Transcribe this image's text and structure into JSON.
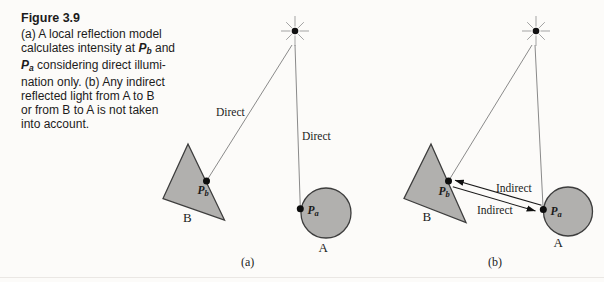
{
  "caption": {
    "title": "Figure 3.9",
    "l1": "(a) A local reflection model",
    "l2_pre": "calculates intensity at ",
    "l2_p": "P",
    "l2_sub": "b",
    "l2_post": " and",
    "l3_p": "P",
    "l3_sub": "a",
    "l3_post": " considering direct illumi-",
    "l4": "nation only. (b) Any indirect",
    "l5": "reflected light from A to B",
    "l6": "or from B to A is not taken",
    "l7": "into account."
  },
  "diagram_a": {
    "label_direct_upper": "Direct",
    "label_direct_lower": "Direct",
    "point_b": {
      "p": "P",
      "sub": "b"
    },
    "point_a": {
      "p": "P",
      "sub": "a"
    },
    "object_b": "B",
    "object_a": "A",
    "sublabel": "(a)"
  },
  "diagram_b": {
    "label_indirect_upper": "Indirect",
    "label_indirect_lower": "Indirect",
    "point_b": {
      "p": "P",
      "sub": "b"
    },
    "point_a": {
      "p": "P",
      "sub": "a"
    },
    "object_b": "B",
    "object_a": "A",
    "sublabel": "(b)"
  },
  "colors": {
    "background": "#fcfbf9",
    "shape_fill": "#b1b0ae",
    "shape_stroke": "#3d3d3d",
    "ray_line": "#8a8a8a",
    "indirect_line": "#1a1a1a",
    "dot": "#0d0d0d",
    "text": "#1b1b1b"
  }
}
